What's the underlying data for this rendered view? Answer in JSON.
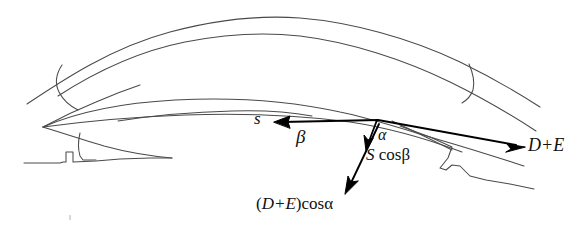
{
  "figure": {
    "kind": "line-drawing-force-diagram",
    "background_color": "#ffffff",
    "ink_color": "#3b3b3b",
    "vector_color": "#000000",
    "width": 587,
    "height": 235
  },
  "labels": {
    "s": "s",
    "beta": "β",
    "alpha": "α",
    "s_cos_beta_italic": "S",
    "s_cos_beta_rest": " cosβ",
    "d_plus_e": "D+E",
    "de_cos_alpha_open": "(",
    "de_cos_alpha_italic": "D+E",
    "de_cos_alpha_rest": ")cosα"
  },
  "vectors": [
    {
      "name": "s",
      "label": "s",
      "from": [
        378,
        120
      ],
      "to": [
        276,
        122
      ],
      "direction": "left",
      "arrowhead": "at-tip"
    },
    {
      "name": "d-plus-e",
      "label": "D+E",
      "from": [
        378,
        120
      ],
      "to": [
        524,
        147
      ],
      "direction": "right-down",
      "arrowhead": "at-tip"
    },
    {
      "name": "s-cos-beta",
      "label": "S cosβ",
      "from": [
        378,
        120
      ],
      "to": [
        368,
        149
      ],
      "direction": "down",
      "arrowhead": "at-tip"
    },
    {
      "name": "d-plus-e-cos-alpha",
      "label": "(D+E)cosα",
      "from": [
        378,
        124
      ],
      "to": [
        345,
        193
      ],
      "direction": "down-left",
      "arrowhead": "at-tip"
    }
  ],
  "angles": [
    {
      "name": "beta",
      "label": "β",
      "between": [
        "s",
        "horizontal"
      ]
    },
    {
      "name": "alpha",
      "label": "α",
      "between": [
        "d-plus-e",
        "s-cos-beta"
      ]
    }
  ]
}
